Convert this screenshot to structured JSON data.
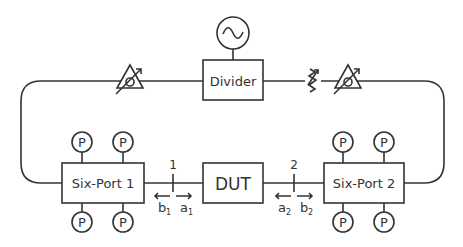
{
  "diagram": {
    "colors": {
      "stroke": "#333333",
      "background": "#ffffff"
    },
    "source": {
      "label": "",
      "icon": "sine-source-icon"
    },
    "divider": {
      "label": "Divider"
    },
    "six_port_1": {
      "label": "Six-Port 1"
    },
    "six_port_2": {
      "label": "Six-Port 2"
    },
    "dut": {
      "label": "DUT"
    },
    "power_detector": {
      "label": "P"
    },
    "reference_planes": [
      {
        "label": "1",
        "left_wave": "b",
        "left_sub": "1",
        "right_wave": "a",
        "right_sub": "1"
      },
      {
        "label": "2",
        "left_wave": "a",
        "left_sub": "2",
        "right_wave": "b",
        "right_sub": "2"
      }
    ],
    "components": [
      "phase-shifter",
      "attenuator",
      "phase-shifter"
    ]
  }
}
